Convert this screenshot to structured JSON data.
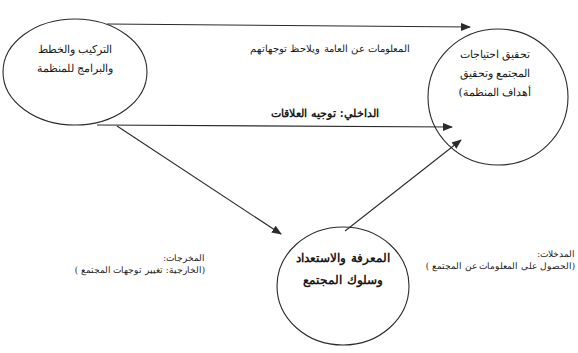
{
  "diagram": {
    "type": "flow-diagram",
    "colors": {
      "stroke": "#2b2b2b",
      "background": "#ffffff",
      "text": "#1a1a1a"
    },
    "nodes": [
      {
        "id": "structure",
        "lines": [
          "التركيب والخطط",
          "والبرامج للمنظمة"
        ]
      },
      {
        "id": "goals",
        "lines": [
          "تحقيق احتياجات",
          "المجتمع وتحقيق",
          "أهداف المنظمة)"
        ]
      },
      {
        "id": "knowledge",
        "lines": [
          "المعرفة والاستعداد",
          "وسلوك المجتمع"
        ]
      }
    ],
    "edges": [
      {
        "from": "structure",
        "to": "goals",
        "label": "المعلومات عن العامة ويلاحظ توجهاتهم"
      },
      {
        "from": "structure",
        "to": "goals",
        "label": "الداخلي: توجيه العلاقات"
      },
      {
        "from": "structure",
        "to": "knowledge",
        "label": ""
      },
      {
        "from": "knowledge",
        "to": "goals",
        "label": ""
      }
    ],
    "notes": {
      "outputs": {
        "title": "المخرجات:",
        "body": "(الخارجية: تغيير توجهات المجتمع )"
      },
      "inputs": {
        "title": "المدخلات:",
        "body": "(الحصول على المعلومات عن المجتمع )"
      }
    }
  }
}
